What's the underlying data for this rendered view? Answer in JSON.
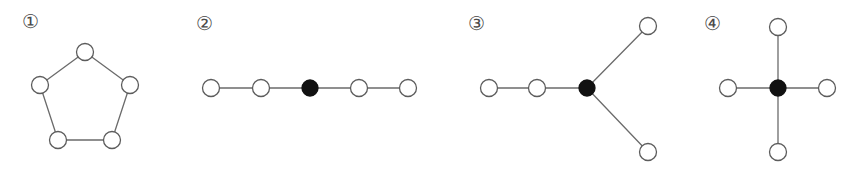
{
  "canvas": {
    "width": 848,
    "height": 179,
    "background": "#ffffff"
  },
  "style": {
    "edge_color": "#6b6b6b",
    "node_outline_color": "#5c5c5c",
    "node_open_fill": "#ffffff",
    "node_filled_fill": "#111111",
    "label_color": "#4a4a4a",
    "node_radius": 8.5,
    "filled_node_radius": 8.0,
    "edge_width": 1.3
  },
  "figures": [
    {
      "id": "figure-1",
      "label": "①",
      "label_name": "circled-one",
      "label_x": 22,
      "label_y": 12,
      "description": "cycle graph on five vertices (pentagon), all vertices open",
      "nodes": [
        {
          "name": "fig1-node-top",
          "x": 85,
          "y": 52,
          "filled": false
        },
        {
          "name": "fig1-node-right",
          "x": 130,
          "y": 85,
          "filled": false
        },
        {
          "name": "fig1-node-bottom-right",
          "x": 112,
          "y": 140,
          "filled": false
        },
        {
          "name": "fig1-node-bottom-left",
          "x": 58,
          "y": 140,
          "filled": false
        },
        {
          "name": "fig1-node-left",
          "x": 40,
          "y": 85,
          "filled": false
        }
      ],
      "edges": [
        {
          "name": "fig1-edge-top-right",
          "from": 0,
          "to": 1
        },
        {
          "name": "fig1-edge-right-bottomright",
          "from": 1,
          "to": 2
        },
        {
          "name": "fig1-edge-bottom",
          "from": 2,
          "to": 3
        },
        {
          "name": "fig1-edge-bottomleft-left",
          "from": 3,
          "to": 4
        },
        {
          "name": "fig1-edge-left-top",
          "from": 4,
          "to": 0
        }
      ]
    },
    {
      "id": "figure-2",
      "label": "②",
      "label_name": "circled-two",
      "label_x": 196,
      "label_y": 14,
      "description": "path graph on five vertices, centre vertex filled",
      "nodes": [
        {
          "name": "fig2-node-1",
          "x": 211,
          "y": 88,
          "filled": false
        },
        {
          "name": "fig2-node-2",
          "x": 261,
          "y": 88,
          "filled": false
        },
        {
          "name": "fig2-node-center",
          "x": 310,
          "y": 88,
          "filled": true
        },
        {
          "name": "fig2-node-4",
          "x": 359,
          "y": 88,
          "filled": false
        },
        {
          "name": "fig2-node-5",
          "x": 408,
          "y": 88,
          "filled": false
        }
      ],
      "edges": [
        {
          "name": "fig2-edge-1-2",
          "from": 0,
          "to": 1
        },
        {
          "name": "fig2-edge-2-3",
          "from": 1,
          "to": 2
        },
        {
          "name": "fig2-edge-3-4",
          "from": 2,
          "to": 3
        },
        {
          "name": "fig2-edge-4-5",
          "from": 3,
          "to": 4
        }
      ]
    },
    {
      "id": "figure-3",
      "label": "③",
      "label_name": "circled-three",
      "label_x": 468,
      "label_y": 14,
      "description": "tree with degree-three filled hub, one path of length two and two pendant branches",
      "nodes": [
        {
          "name": "fig3-node-far-left",
          "x": 489,
          "y": 88,
          "filled": false
        },
        {
          "name": "fig3-node-left",
          "x": 537,
          "y": 88,
          "filled": false
        },
        {
          "name": "fig3-node-center",
          "x": 587,
          "y": 88,
          "filled": true
        },
        {
          "name": "fig3-node-upper-right",
          "x": 648,
          "y": 26,
          "filled": false
        },
        {
          "name": "fig3-node-lower-right",
          "x": 648,
          "y": 152,
          "filled": false
        }
      ],
      "edges": [
        {
          "name": "fig3-edge-farleft-left",
          "from": 0,
          "to": 1
        },
        {
          "name": "fig3-edge-left-center",
          "from": 1,
          "to": 2
        },
        {
          "name": "fig3-edge-center-upper",
          "from": 2,
          "to": 3
        },
        {
          "name": "fig3-edge-center-lower",
          "from": 2,
          "to": 4
        }
      ]
    },
    {
      "id": "figure-4",
      "label": "④",
      "label_name": "circled-four",
      "label_x": 704,
      "label_y": 14,
      "description": "star graph K1,4 with filled centre and four open leaves",
      "nodes": [
        {
          "name": "fig4-node-center",
          "x": 778,
          "y": 88,
          "filled": true
        },
        {
          "name": "fig4-node-top",
          "x": 778,
          "y": 27,
          "filled": false
        },
        {
          "name": "fig4-node-right",
          "x": 827,
          "y": 88,
          "filled": false
        },
        {
          "name": "fig4-node-bottom",
          "x": 778,
          "y": 152,
          "filled": false
        },
        {
          "name": "fig4-node-left",
          "x": 728,
          "y": 88,
          "filled": false
        }
      ],
      "edges": [
        {
          "name": "fig4-edge-center-top",
          "from": 0,
          "to": 1
        },
        {
          "name": "fig4-edge-center-right",
          "from": 0,
          "to": 2
        },
        {
          "name": "fig4-edge-center-bottom",
          "from": 0,
          "to": 3
        },
        {
          "name": "fig4-edge-center-left",
          "from": 0,
          "to": 4
        }
      ]
    }
  ]
}
